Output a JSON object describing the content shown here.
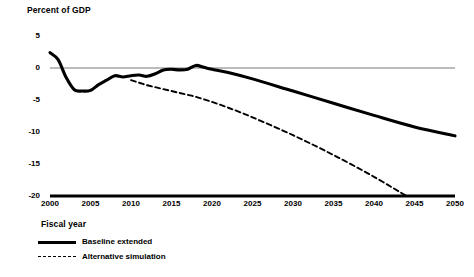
{
  "chart_data": {
    "type": "line",
    "title": "",
    "ylabel": "Percent of GDP",
    "xlabel": "Fiscal year",
    "xlim": [
      2000,
      2050
    ],
    "ylim": [
      -20,
      5
    ],
    "yticks": [
      5,
      0,
      -5,
      -10,
      -15,
      -20
    ],
    "ytick_labels": [
      "5",
      "0",
      "-5",
      "-10",
      "-15",
      "-20"
    ],
    "xticks": [
      2000,
      2005,
      2010,
      2015,
      2020,
      2025,
      2030,
      2035,
      2040,
      2045,
      2050
    ],
    "xtick_labels": [
      "2000",
      "2005",
      "2010",
      "2015",
      "2020",
      "2025",
      "2030",
      "2035",
      "2040",
      "2045",
      "2050"
    ],
    "grid": false,
    "zero_line": true,
    "legend_position": "below-axis-left",
    "series": [
      {
        "name": "Baseline extended",
        "style": "solid",
        "color": "#000000",
        "x": [
          2000,
          2001,
          2002,
          2003,
          2004,
          2005,
          2006,
          2007,
          2008,
          2009,
          2010,
          2011,
          2012,
          2013,
          2014,
          2015,
          2016,
          2017,
          2018,
          2019,
          2020,
          2022,
          2025,
          2030,
          2035,
          2040,
          2045,
          2050
        ],
        "values": [
          2.4,
          1.3,
          -1.5,
          -3.4,
          -3.6,
          -3.5,
          -2.6,
          -1.9,
          -1.2,
          -1.4,
          -1.2,
          -1.1,
          -1.3,
          -0.9,
          -0.3,
          -0.2,
          -0.3,
          -0.2,
          0.4,
          0.1,
          -0.2,
          -0.7,
          -1.7,
          -3.6,
          -5.5,
          -7.4,
          -9.2,
          -10.6
        ]
      },
      {
        "name": "Alternative simulation",
        "style": "dashed",
        "color": "#000000",
        "x": [
          2010,
          2011,
          2012,
          2013,
          2014,
          2015,
          2016,
          2017,
          2018,
          2020,
          2022,
          2025,
          2030,
          2035,
          2040,
          2044
        ],
        "values": [
          -1.9,
          -2.3,
          -2.7,
          -3.0,
          -3.3,
          -3.6,
          -3.9,
          -4.2,
          -4.5,
          -5.3,
          -6.2,
          -7.7,
          -10.5,
          -13.6,
          -17.0,
          -20.0
        ]
      }
    ]
  },
  "legend": {
    "items": [
      {
        "label": "Baseline extended",
        "style": "solid"
      },
      {
        "label": "Alternative simulation",
        "style": "dashed"
      }
    ]
  }
}
